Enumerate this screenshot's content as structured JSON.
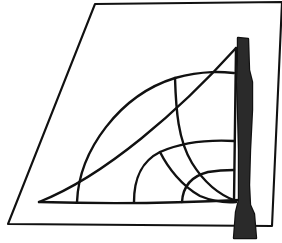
{
  "figure": {
    "caption": "Right triangle with nested circular arcs and an upright stippled rod",
    "background_color": "#ffffff",
    "ink_color": "#111111",
    "width": 282,
    "height": 243
  },
  "sheet": {
    "name": "paper-sheet",
    "description": "Quadrilateral sheet of paper seen in perspective",
    "corners": [
      {
        "label": "top-left",
        "x": 95,
        "y": 4
      },
      {
        "label": "top-right",
        "x": 282,
        "y": 2
      },
      {
        "label": "bottom-right",
        "x": 272,
        "y": 226
      },
      {
        "label": "bottom-left",
        "x": 8,
        "y": 224
      }
    ],
    "outline_path": "M 95 4 L 282 2 L 272 226 L 8 224 Z",
    "fill": "#ffffff",
    "stroke": "#111111",
    "stroke_width": 2.1
  },
  "triangle": {
    "name": "right-triangle",
    "description": "Right triangle drawn on the sheet with apex at top right",
    "vertices": [
      {
        "label": "left-apex",
        "x": 39,
        "y": 202
      },
      {
        "label": "top-apex",
        "x": 236,
        "y": 48
      },
      {
        "label": "bottom-right",
        "x": 234,
        "y": 201
      }
    ],
    "hypotenuse_path": "M 39 202 C 105 176, 180 110, 236 48",
    "vertical_leg_path": "M 236 48 L 234 201",
    "base_path": "M 39 202 C 110 204, 180 203, 240 200"
  },
  "arcs": [
    {
      "name": "arc-outer",
      "description": "Largest arc sweeping from baseline up to the vertical leg",
      "path": "M 77 202 C 79 150, 120 95, 175 78 C 205 70, 224 72, 234 73",
      "stroke_width": 2.4
    },
    {
      "name": "arc-middle",
      "description": "Medium arc from baseline to vertical leg, crossing the outer arc",
      "path": "M 134 202 C 134 180, 140 162, 160 152 C 185 141, 215 140, 234 141",
      "stroke_width": 2.4
    },
    {
      "name": "arc-inner",
      "description": "Small arc near the bottom right corner",
      "path": "M 182 202 C 183 185, 192 176, 208 172 C 220 170, 229 170, 234 170",
      "stroke_width": 2.4
    },
    {
      "name": "arc-descending-large",
      "description": "Long arc descending from upper region down to the baseline",
      "path": "M 175 78 C 176 110, 178 140, 192 163 C 205 184, 222 196, 236 201",
      "stroke_width": 2.4
    },
    {
      "name": "arc-descending-small",
      "description": "Short descending arc crossing the inner arcs near the base",
      "path": "M 160 152 C 168 168, 182 186, 200 196 C 212 201, 224 203, 236 202",
      "stroke_width": 2.4
    }
  ],
  "rod": {
    "name": "measuring-rod",
    "description": "Upright stippled rod or ruler standing against the right side of the construction",
    "top_y": 38,
    "bottom_y": 238,
    "top_width": 10,
    "waist_width": 9,
    "base_width": 17,
    "outline_path": "M 238 38 L 248 39 L 249 70 L 252 82 L 252 110 L 250 150 L 249 185 L 250 205 L 254 214 L 256 238 L 234 238 L 236 212 L 239 200 L 239 150 L 238 110 L 237 82 L 238 60 Z",
    "fill": "#ffffff",
    "stroke": "#111111",
    "stroke_width": 2.4,
    "texture": "stipple-dots",
    "dot_color": "#2a2a2a"
  },
  "labels": {
    "none_visible": true
  }
}
